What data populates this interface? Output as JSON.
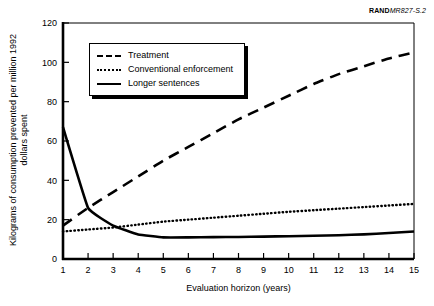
{
  "source_tag": {
    "bold_part": "RAND",
    "rest": "MR827-S.2"
  },
  "legend": {
    "position": "inside-top-left",
    "items": [
      {
        "label": "Treatment",
        "style": "dashed"
      },
      {
        "label": "Conventional enforcement",
        "style": "dotted"
      },
      {
        "label": "Longer sentences",
        "style": "solid"
      }
    ]
  },
  "chart_data": {
    "type": "line",
    "title": "",
    "xlabel": "Evaluation horizon (years)",
    "ylabel": "Kilograms of consumption prevented per million 1992 dollars spent",
    "xlim": [
      1,
      15
    ],
    "ylim": [
      0,
      120
    ],
    "xticks": [
      1,
      2,
      3,
      4,
      5,
      6,
      7,
      8,
      9,
      10,
      11,
      12,
      13,
      14,
      15
    ],
    "yticks": [
      0,
      20,
      40,
      60,
      80,
      100,
      120
    ],
    "xtick_labels": [
      "1",
      "2",
      "3",
      "4",
      "5",
      "6",
      "7",
      "8",
      "9",
      "10",
      "11",
      "12",
      "13",
      "14",
      "15"
    ],
    "ytick_labels": [
      "0",
      "20",
      "40",
      "60",
      "80",
      "100",
      "120"
    ],
    "grid": false,
    "legend_position": "upper left",
    "x": [
      1,
      2,
      3,
      4,
      5,
      6,
      7,
      8,
      9,
      10,
      11,
      12,
      13,
      14,
      15
    ],
    "series": [
      {
        "name": "Treatment",
        "style": "dashed",
        "color": "#000000",
        "values": [
          17,
          26,
          34,
          42,
          50,
          57,
          64,
          71,
          77,
          83,
          89,
          94,
          98,
          102,
          105
        ]
      },
      {
        "name": "Conventional enforcement",
        "style": "dotted",
        "color": "#000000",
        "values": [
          14,
          15,
          16,
          17.5,
          19,
          20,
          21,
          22,
          23,
          24,
          24.8,
          25.6,
          26.4,
          27.2,
          28
        ]
      },
      {
        "name": "Longer sentences",
        "style": "solid",
        "color": "#000000",
        "values": [
          67,
          26,
          17,
          12.5,
          11,
          11,
          11.1,
          11.2,
          11.4,
          11.6,
          11.8,
          12.1,
          12.5,
          13.2,
          14
        ]
      }
    ]
  }
}
